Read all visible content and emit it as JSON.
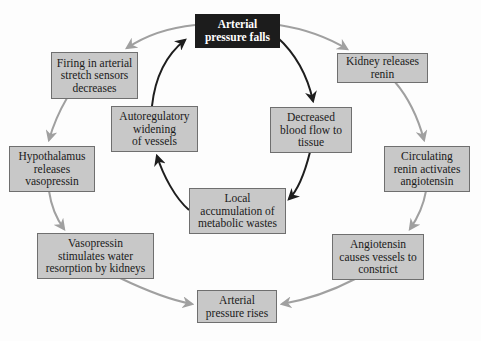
{
  "diagram": {
    "type": "feedback-cycle",
    "colors": {
      "box_fill": "#c8c8c8",
      "box_border": "#6f6f6f",
      "start_box_fill": "#1c1c1c",
      "start_box_text": "#ffffff",
      "local_arrow": "#1e1e1e",
      "systemic_arrow": "#a0a0a0"
    },
    "nodes": {
      "start": "Arterial\npressure falls",
      "firing": "Firing in arterial\nstretch sensors\ndecreases",
      "kidney": "Kidney releases\nrenin",
      "autoreg": "Autoregulatory\nwidening\nof vessels",
      "decreased": "Decreased\nblood flow to\ntissue",
      "hypothalamus": "Hypothalamus\nreleases\nvasopressin",
      "circulating": "Circulating\nrenin activates\nangiotensin",
      "local": "Local\naccumulation of\nmetabolic wastes",
      "vasopressin": "Vasopressin\nstimulates water\nresorption by kidneys",
      "angiotensin": "Angiotensin\ncauses vessels to\nconstrict",
      "end": "Arterial\npressure rises"
    },
    "edges": [
      {
        "from": "start",
        "to": "firing",
        "style": "systemic"
      },
      {
        "from": "firing",
        "to": "hypothalamus",
        "style": "systemic"
      },
      {
        "from": "hypothalamus",
        "to": "vasopressin",
        "style": "systemic"
      },
      {
        "from": "vasopressin",
        "to": "end",
        "style": "systemic"
      },
      {
        "from": "start",
        "to": "kidney",
        "style": "systemic"
      },
      {
        "from": "kidney",
        "to": "circulating",
        "style": "systemic"
      },
      {
        "from": "circulating",
        "to": "angiotensin",
        "style": "systemic"
      },
      {
        "from": "angiotensin",
        "to": "end",
        "style": "systemic"
      },
      {
        "from": "start",
        "to": "decreased",
        "style": "local"
      },
      {
        "from": "decreased",
        "to": "local",
        "style": "local"
      },
      {
        "from": "local",
        "to": "autoreg",
        "style": "local"
      },
      {
        "from": "autoreg",
        "to": "start",
        "style": "local"
      }
    ]
  }
}
